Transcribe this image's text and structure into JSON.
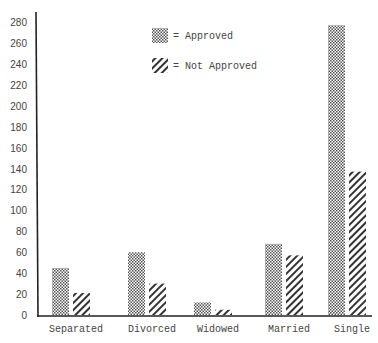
{
  "chart_data": {
    "type": "bar",
    "title": "",
    "xlabel": "",
    "ylabel": "",
    "ylim": [
      0,
      280
    ],
    "yticks": [
      0,
      20,
      40,
      60,
      80,
      100,
      120,
      140,
      160,
      180,
      200,
      220,
      240,
      260,
      280
    ],
    "grid": false,
    "legend_position": "top-center",
    "categories": [
      "Separated",
      "Divorced",
      "Widowed",
      "Married",
      "Single"
    ],
    "series": [
      {
        "name": "Approved",
        "legend_label": "= Approved",
        "pattern": "checkered",
        "values": [
          45,
          60,
          12,
          68,
          277
        ]
      },
      {
        "name": "Not Approved",
        "legend_label": "= Not Approved",
        "pattern": "diagonal-hatch",
        "values": [
          21,
          30,
          5,
          57,
          137
        ]
      }
    ]
  }
}
